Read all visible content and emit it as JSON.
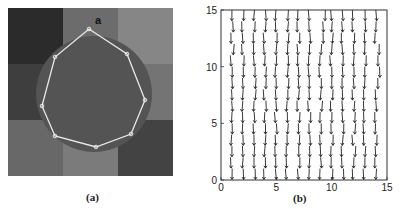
{
  "panel_a": {
    "caption": "(a)",
    "label": "a",
    "grid_colors": [
      [
        "#2b2b2b",
        "#6c6c6c",
        "#868686"
      ],
      [
        "#3e3e3e",
        "#5a5a5a",
        "#747474"
      ],
      [
        "#686868",
        "#7b7b7b",
        "#434343"
      ]
    ],
    "circle_color": "#545454",
    "polygon_vertices": [
      [
        89,
        29
      ],
      [
        127,
        54
      ],
      [
        145,
        100
      ],
      [
        131,
        134
      ],
      [
        96,
        147
      ],
      [
        55,
        136
      ],
      [
        42,
        106
      ],
      [
        55,
        57
      ]
    ],
    "polygon_color": "#e8e8e8"
  },
  "panel_b": {
    "caption": "(b)"
  },
  "chart_data": {
    "type": "quiver",
    "title": "",
    "xlabel": "",
    "ylabel": "",
    "xlim": [
      0,
      15
    ],
    "ylim": [
      0,
      15
    ],
    "xticks": [
      0,
      5,
      10,
      15
    ],
    "yticks": [
      0,
      5,
      10,
      15
    ],
    "grid": false,
    "legend": null,
    "columns_x": [
      1,
      2,
      3,
      4,
      5,
      6,
      7,
      8,
      9,
      10,
      11,
      12,
      13,
      14
    ],
    "dominant_direction": "down"
  }
}
